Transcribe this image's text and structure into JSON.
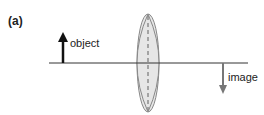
{
  "figure": {
    "panel_label": "(a)",
    "object_label": "object",
    "image_label": "image",
    "colors": {
      "axis": "#333333",
      "object_arrow": "#111111",
      "image_arrow": "#777777",
      "lens_fill": "#e6e6e6",
      "lens_stroke": "#888888"
    }
  }
}
